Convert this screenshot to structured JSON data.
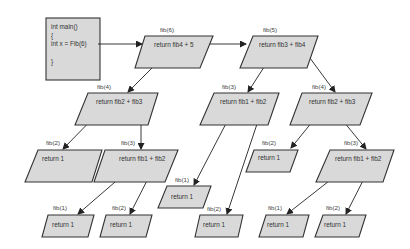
{
  "diagram": {
    "colors": {
      "shape_fill": "#d9d9d9",
      "shape_stroke": "#333333",
      "edge": "#222222",
      "background": "#ffffff"
    },
    "main_box": {
      "lines": [
        "int main()",
        "{",
        "int x = Fib(6)",
        "",
        "}"
      ]
    },
    "nodes": [
      {
        "id": "n6",
        "label": "fib(6)",
        "text": "return fib4 + 5"
      },
      {
        "id": "n5",
        "label": "fib(5)",
        "text": "return fib3 + fib4"
      },
      {
        "id": "n4a",
        "label": "fib(4)",
        "text": "return fib2 + fib3"
      },
      {
        "id": "n3a",
        "label": "fib(3)",
        "text": "return fib1 + fib2"
      },
      {
        "id": "n4b",
        "label": "fib(4)",
        "text": "return fib2 + fib3"
      },
      {
        "id": "n2a",
        "label": "fib(2)",
        "text": "return 1"
      },
      {
        "id": "n3b",
        "label": "fib(3)",
        "text": "return fib1 + fib2"
      },
      {
        "id": "n1a",
        "label": "fib(1)",
        "text": "return 1"
      },
      {
        "id": "n2b",
        "label": "fib(2)",
        "text": "return 1"
      },
      {
        "id": "n3c",
        "label": "fib(3)",
        "text": "return fib1 + fib2"
      },
      {
        "id": "n1b",
        "label": "fib(1)",
        "text": "return 1"
      },
      {
        "id": "n2c",
        "label": "fib(2)",
        "text": "return 1"
      },
      {
        "id": "n2d",
        "label": "fib(2)",
        "text": "return 1"
      },
      {
        "id": "n1c",
        "label": "fib(1)",
        "text": "return 1"
      },
      {
        "id": "n2e",
        "label": "fib(2)",
        "text": "return 1"
      }
    ],
    "edges": [
      [
        "main",
        "n6"
      ],
      [
        "n6",
        "n5"
      ],
      [
        "n6",
        "n4a"
      ],
      [
        "n5",
        "n3a"
      ],
      [
        "n5",
        "n4b"
      ],
      [
        "n4a",
        "n2a"
      ],
      [
        "n4a",
        "n3b"
      ],
      [
        "n3b",
        "n1a"
      ],
      [
        "n3b",
        "n2b"
      ],
      [
        "n3a",
        "n1b"
      ],
      [
        "n3a",
        "n2d"
      ],
      [
        "n4b",
        "n2c"
      ],
      [
        "n4b",
        "n3c"
      ],
      [
        "n3c",
        "n1c"
      ],
      [
        "n3c",
        "n2e"
      ]
    ]
  }
}
